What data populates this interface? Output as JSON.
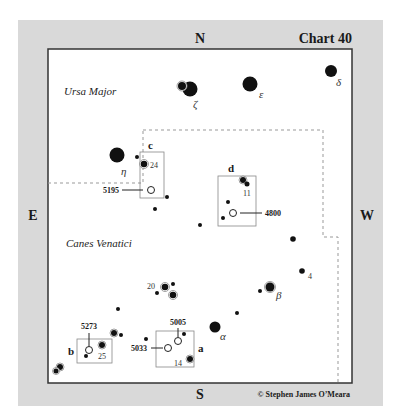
{
  "chart": {
    "title": "Chart 40",
    "credit": "© Stephen James O’Meara",
    "directions": {
      "north": "N",
      "south": "S",
      "east": "E",
      "west": "W"
    },
    "constellations": [
      {
        "name": "Ursa Major"
      },
      {
        "name": "Canes Venatici"
      }
    ],
    "named_stars": [
      {
        "label": "ζ"
      },
      {
        "label": "ε"
      },
      {
        "label": "δ"
      },
      {
        "label": "η"
      },
      {
        "label": "α"
      },
      {
        "label": "β"
      }
    ],
    "numbered_stars": [
      {
        "label": "24"
      },
      {
        "label": "11"
      },
      {
        "label": "4"
      },
      {
        "label": "20"
      },
      {
        "label": "25"
      },
      {
        "label": "14"
      }
    ],
    "finder_boxes": [
      {
        "label": "a",
        "objects": [
          "5005",
          "5033"
        ]
      },
      {
        "label": "b",
        "objects": [
          "5273"
        ]
      },
      {
        "label": "c",
        "objects": [
          "5195"
        ]
      },
      {
        "label": "d",
        "objects": [
          "4800"
        ]
      }
    ],
    "galaxies": [
      {
        "ngc": "5195"
      },
      {
        "ngc": "4800"
      },
      {
        "ngc": "5273"
      },
      {
        "ngc": "5005"
      },
      {
        "ngc": "5033"
      }
    ],
    "colors": {
      "frame": "#d9d9d9",
      "plot_bg": "#ffffff",
      "star": "#111111",
      "boundary": "#999999"
    }
  }
}
